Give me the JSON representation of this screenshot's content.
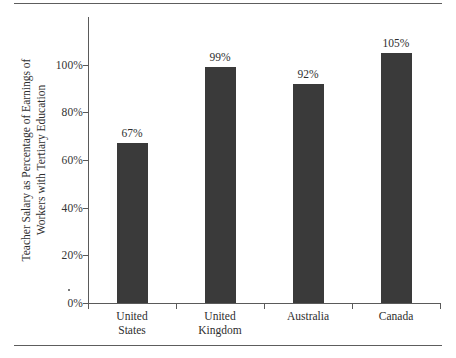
{
  "chart_data": {
    "type": "bar",
    "title": "",
    "subtitle": "",
    "xlabel": "",
    "ylabel": "Teacher Salary as Percentage of Earnings of Workers with Tertiary Education",
    "ylabel_lines": [
      "Teacher Salary as Percentage of Earnings of",
      "Workers with Tertiary Education"
    ],
    "categories": [
      "United States",
      "United Kingdom",
      "Australia",
      "Canada"
    ],
    "category_lines": [
      [
        "United",
        "States"
      ],
      [
        "United",
        "Kingdom"
      ],
      [
        "Australia"
      ],
      [
        "Canada"
      ]
    ],
    "values": [
      67,
      99,
      92,
      105
    ],
    "value_labels": [
      "67%",
      "99%",
      "92%",
      "105%"
    ],
    "ylim": [
      0,
      120
    ],
    "ytick_values": [
      0,
      20,
      40,
      60,
      80,
      100
    ],
    "ytick_labels": [
      "0%",
      "20%",
      "40%",
      "60%",
      "80%",
      "100%"
    ],
    "grid": false,
    "legend": null,
    "legend_position": "none",
    "bar_color": "#3a3a3a",
    "axis_color": "#5a5a5a",
    "text_color": "#2e2e2e",
    "background_color": "#ffffff"
  }
}
